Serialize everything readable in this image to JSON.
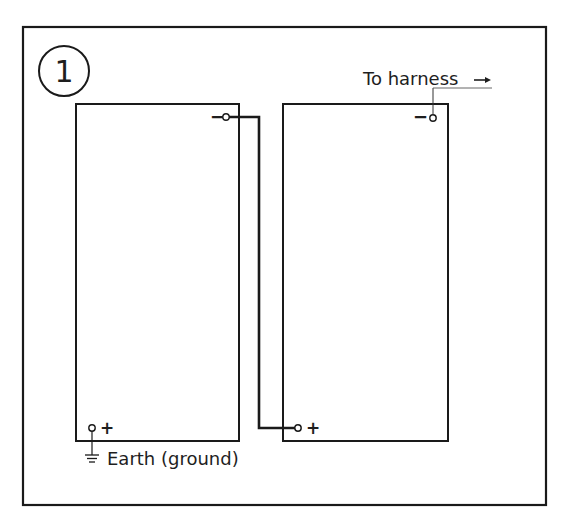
{
  "figure": {
    "number": "1",
    "colors": {
      "line": "#1a1a1a",
      "text": "#1e1e1e",
      "background": "#ffffff"
    }
  },
  "batteries": [
    {
      "name": "battery-1",
      "negative_label": "−",
      "positive_label": "+"
    },
    {
      "name": "battery-2",
      "negative_label": "−",
      "positive_label": "+"
    }
  ],
  "labels": {
    "to_harness": "To harness",
    "earth": "Earth (ground)"
  },
  "connections": [
    {
      "from": "battery-1 negative",
      "to": "battery-2 positive",
      "type": "series-link"
    },
    {
      "from": "battery-2 negative",
      "to": "harness",
      "type": "lead"
    },
    {
      "from": "battery-1 positive",
      "to": "earth",
      "type": "ground"
    }
  ]
}
